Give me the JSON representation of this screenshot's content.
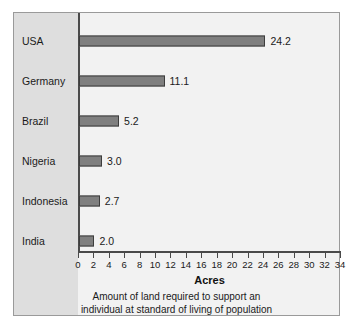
{
  "chart_data": {
    "type": "bar",
    "orientation": "horizontal",
    "title": "",
    "xlabel": "Acres",
    "ylabel": "",
    "xlim": [
      0,
      34
    ],
    "xticks": [
      0,
      2,
      4,
      6,
      8,
      10,
      12,
      14,
      16,
      18,
      20,
      22,
      24,
      26,
      28,
      30,
      32,
      34
    ],
    "xtick_labels": [
      "0",
      "2",
      "4",
      "6",
      "8",
      "10",
      "12",
      "14",
      "16",
      "18",
      "20",
      "22",
      "24",
      "26",
      "28",
      "30",
      "32",
      "34"
    ],
    "grid": false,
    "legend": false,
    "categories": [
      "USA",
      "Germany",
      "Brazil",
      "Nigeria",
      "Indonesia",
      "India"
    ],
    "values": [
      24.2,
      11.1,
      5.2,
      3.0,
      2.7,
      2.0
    ],
    "value_labels": [
      "24.2",
      "11.1",
      "5.2",
      "3.0",
      "2.7",
      "2.0"
    ],
    "caption_line1": "Amount of land required to support an",
    "caption_line2": "individual at standard of living of population",
    "bar_color": "#7f7f7f",
    "bar_border_color": "#3d3d3d",
    "axis_color": "#4a4a4a",
    "plot_background": "#f2f2f2",
    "label_band_background": "#dedede",
    "frame_border_color": "#9a9a9a"
  }
}
